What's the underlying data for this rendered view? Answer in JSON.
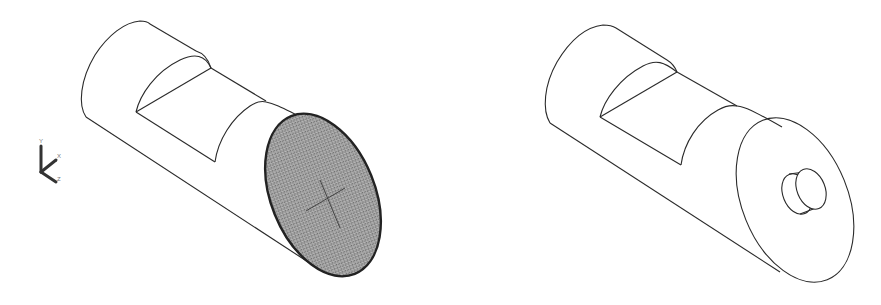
{
  "figure": {
    "background": "#ffffff",
    "line_color": "#2a2a2a",
    "shaded_face_color": "#8f8f8f"
  },
  "ucs_icon": {
    "axes": [
      "Y",
      "X",
      "Z"
    ],
    "y_label": "Y",
    "x_label": "X",
    "z_label": "Z"
  },
  "views": [
    {
      "id": "left",
      "label": "Cylinder with selected (shaded) end face",
      "end_face": "shaded-selected",
      "features": [
        "notch",
        "center-cross"
      ]
    },
    {
      "id": "right",
      "label": "Cylinder with boss extruded on end face",
      "end_face": "outline",
      "features": [
        "notch",
        "cylindrical-boss"
      ]
    }
  ]
}
